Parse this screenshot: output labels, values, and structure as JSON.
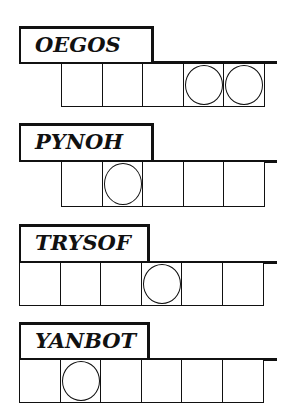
{
  "puzzles": [
    {
      "word": "OEGOS",
      "cells": 5,
      "circled": [
        4,
        5
      ]
    },
    {
      "word": "PYNOH",
      "cells": 5,
      "circled": [
        2
      ]
    },
    {
      "word": "TRYSOF",
      "cells": 6,
      "circled": [
        4
      ]
    },
    {
      "word": "YANBOT",
      "cells": 6,
      "circled": [
        2
      ]
    }
  ]
}
